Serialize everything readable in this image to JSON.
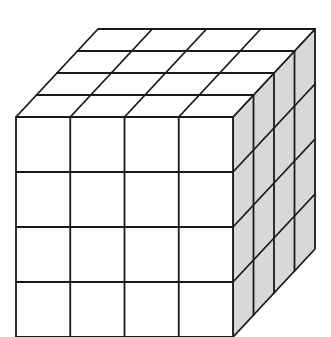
{
  "diagram": {
    "type": "cube",
    "grid_size": 4,
    "visible_faces": [
      "front",
      "top",
      "right"
    ],
    "colors": {
      "background": "#ffffff",
      "front_face": "#ffffff",
      "top_face": "#ffffff",
      "right_face": "#d8d8d8",
      "lines": "#1a1a1a"
    },
    "geometry": {
      "front_top_left": [
        16,
        117
      ],
      "front_width": 217,
      "front_height": 220,
      "depth_vector": [
        82,
        -88
      ]
    }
  }
}
